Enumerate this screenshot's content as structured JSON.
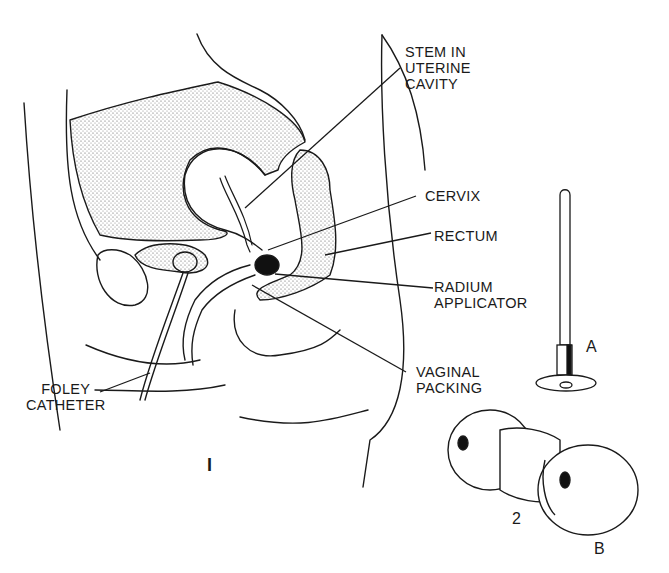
{
  "figure": {
    "labels": {
      "stem": "STEM IN\nUTERINE\nCAVITY",
      "cervix": "CERVIX",
      "rectum": "RECTUM",
      "radium_applicator": "RADIUM\nAPPLICATOR",
      "vaginal_packing": "VAGINAL\nPACKING",
      "foley_catheter": "FOLEY\nCATHETER"
    },
    "figure_numbers": {
      "main": "I",
      "parts": "2"
    },
    "parts": {
      "a": "A",
      "b": "B"
    },
    "colors": {
      "line": "#1a1a1a",
      "stipple": "#cfcfcf",
      "background": "#ffffff"
    }
  }
}
